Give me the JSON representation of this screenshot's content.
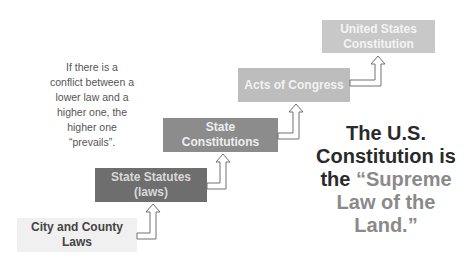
{
  "diagram": {
    "levels": [
      {
        "label": "City and County Laws",
        "line1": "City and County",
        "line2": "Laws",
        "color": "#f0f0f0"
      },
      {
        "label": "State Statutes (laws)",
        "line1": "State Statutes",
        "line2": "(laws)",
        "color": "#6e6e6e"
      },
      {
        "label": "State Constitutions",
        "line1": "State",
        "line2": "Constitutions",
        "color": "#8c8c8c"
      },
      {
        "label": "Acts of Congress",
        "line1": "Acts of Congress",
        "line2": "",
        "color": "#bdbdbd"
      },
      {
        "label": "United States Constitution",
        "line1": "United States",
        "line2": "Constitution",
        "color": "#c8c8c8"
      }
    ],
    "note": {
      "lines": [
        "If there is a",
        "conflict between a",
        "lower law and a",
        "higher one, the",
        "higher one",
        "“prevails”."
      ]
    },
    "callout": {
      "part1": "The U.S. Constitution is the ",
      "highlight": "“Supreme Law of the Land.”"
    }
  }
}
